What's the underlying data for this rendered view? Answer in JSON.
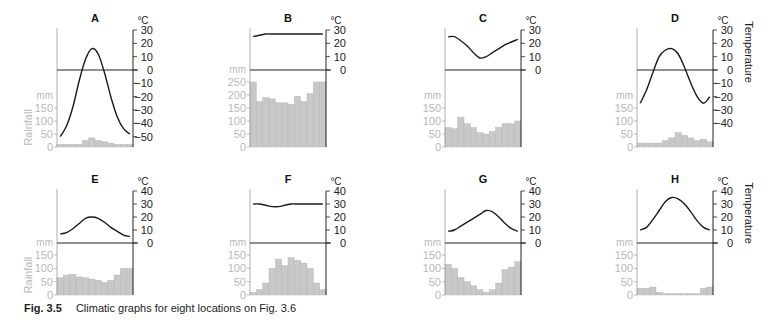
{
  "caption": {
    "label": "Fig. 3.5",
    "text": "Climatic graphs for eight locations on Fig. 3.6"
  },
  "labels": {
    "temp_unit": "°C",
    "rain_unit": "mm",
    "rain_axis": "Rainfall",
    "temp_axis": "Temperature"
  },
  "colors": {
    "bar": "#c8c8c8",
    "bar_edge": "#b0b0b0",
    "line": "#1a1a1a",
    "axis": "#222222",
    "rain_text": "#b8b8b8"
  },
  "chart_data": [
    {
      "type": "bar+line",
      "title": "A",
      "row": 0,
      "col": 0,
      "temp_ticks": [
        30,
        20,
        10,
        0,
        -10,
        -20,
        -30,
        -40,
        -50
      ],
      "rain_ticks": [
        150,
        100,
        50,
        0
      ],
      "temperature": [
        -50,
        -42,
        -28,
        -8,
        8,
        16,
        12,
        -2,
        -20,
        -35,
        -44,
        -48
      ],
      "rainfall": [
        10,
        10,
        10,
        10,
        25,
        35,
        25,
        20,
        15,
        10,
        10,
        10
      ],
      "show_rain_axis_label": true,
      "show_temp_axis_label": false
    },
    {
      "type": "bar+line",
      "title": "B",
      "row": 0,
      "col": 1,
      "temp_ticks": [
        30,
        20,
        10,
        0
      ],
      "rain_ticks": [
        250,
        200,
        150,
        100,
        50,
        0
      ],
      "temperature": [
        25,
        26,
        27,
        27,
        27,
        27,
        27,
        27,
        27,
        27,
        27,
        27
      ],
      "rainfall": [
        250,
        175,
        190,
        185,
        170,
        170,
        165,
        195,
        175,
        205,
        250,
        250
      ],
      "show_rain_axis_label": false,
      "show_temp_axis_label": false
    },
    {
      "type": "bar+line",
      "title": "C",
      "row": 0,
      "col": 2,
      "temp_ticks": [
        30,
        20,
        10,
        0
      ],
      "rain_ticks": [
        150,
        100,
        50,
        0
      ],
      "temperature": [
        25,
        25,
        22,
        18,
        13,
        9,
        10,
        13,
        16,
        19,
        21,
        23
      ],
      "rainfall": [
        75,
        70,
        115,
        90,
        75,
        55,
        50,
        60,
        75,
        90,
        90,
        100
      ],
      "show_rain_axis_label": false,
      "show_temp_axis_label": false
    },
    {
      "type": "bar+line",
      "title": "D",
      "row": 0,
      "col": 3,
      "temp_ticks": [
        30,
        20,
        10,
        0,
        -10,
        -20,
        -30,
        -40
      ],
      "rain_ticks": [
        150,
        100,
        50,
        0
      ],
      "temperature": [
        -25,
        -15,
        -2,
        10,
        15,
        16,
        12,
        2,
        -10,
        -20,
        -25,
        -20
      ],
      "rainfall": [
        15,
        15,
        15,
        15,
        25,
        35,
        55,
        45,
        35,
        25,
        30,
        20
      ],
      "show_rain_axis_label": false,
      "show_temp_axis_label": true
    },
    {
      "type": "bar+line",
      "title": "E",
      "row": 1,
      "col": 0,
      "temp_ticks": [
        40,
        30,
        20,
        10,
        0
      ],
      "rain_ticks": [
        150,
        100,
        50,
        0
      ],
      "temperature": [
        7,
        8,
        11,
        15,
        19,
        20,
        19,
        16,
        12,
        9,
        6,
        5
      ],
      "rainfall": [
        65,
        75,
        78,
        68,
        65,
        60,
        55,
        48,
        55,
        75,
        100,
        100
      ],
      "show_rain_axis_label": true,
      "show_temp_axis_label": false
    },
    {
      "type": "bar+line",
      "title": "F",
      "row": 1,
      "col": 1,
      "temp_ticks": [
        40,
        30,
        20,
        10,
        0
      ],
      "rain_ticks": [
        150,
        100,
        50,
        0
      ],
      "temperature": [
        30,
        30,
        29,
        28,
        28,
        29,
        30,
        30,
        30,
        30,
        30,
        30
      ],
      "rainfall": [
        10,
        20,
        45,
        100,
        135,
        110,
        140,
        130,
        120,
        100,
        45,
        20
      ],
      "show_rain_axis_label": false,
      "show_temp_axis_label": false
    },
    {
      "type": "bar+line",
      "title": "G",
      "row": 1,
      "col": 2,
      "temp_ticks": [
        40,
        30,
        20,
        10,
        0
      ],
      "rain_ticks": [
        150,
        100,
        50,
        0
      ],
      "temperature": [
        9,
        10,
        13,
        16,
        19,
        22,
        25,
        24,
        20,
        15,
        11,
        9
      ],
      "rainfall": [
        115,
        100,
        65,
        50,
        35,
        20,
        10,
        20,
        45,
        95,
        105,
        125
      ],
      "show_rain_axis_label": false,
      "show_temp_axis_label": false
    },
    {
      "type": "bar+line",
      "title": "H",
      "row": 1,
      "col": 3,
      "temp_ticks": [
        40,
        30,
        20,
        10,
        0
      ],
      "rain_ticks": [
        150,
        100,
        50,
        0
      ],
      "temperature": [
        10,
        12,
        18,
        25,
        32,
        35,
        34,
        30,
        24,
        17,
        12,
        10
      ],
      "rainfall": [
        25,
        25,
        30,
        10,
        5,
        5,
        5,
        5,
        5,
        5,
        25,
        30
      ],
      "show_rain_axis_label": false,
      "show_temp_axis_label": true
    }
  ]
}
